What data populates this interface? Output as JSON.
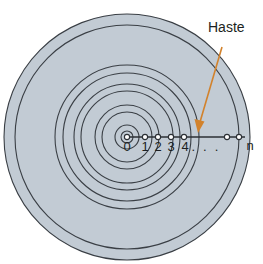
{
  "figure": {
    "title": "Haste",
    "background_color": "#ffffff"
  },
  "colors": {
    "band_fill": "#c2cbd4",
    "band_stroke": "#3a3f45",
    "axis_stroke": "#2b2f34",
    "pointer": "#d2822c",
    "text": "#1c1f22",
    "tick_fill": "#ffffff"
  },
  "callout": {
    "label": "Haste",
    "label_x": 196,
    "label_y": 22,
    "arrow_start_x": 222,
    "arrow_start_y": 47,
    "arrow_end_x": 198,
    "arrow_end_y": 130
  },
  "center": {
    "x": 127,
    "y": 137
  },
  "rings": [
    {
      "name": "ring-1",
      "outer_radius": 12,
      "inner_radius": 6
    },
    {
      "name": "ring-2",
      "outer_radius": 32,
      "inner_radius": 25
    },
    {
      "name": "ring-3",
      "outer_radius": 53,
      "inner_radius": 46
    },
    {
      "name": "ring-4",
      "outer_radius": 72,
      "inner_radius": 64
    },
    {
      "name": "ring-n",
      "outer_radius": 123,
      "inner_radius": 112
    }
  ],
  "axis": {
    "start_x": 127,
    "end_x": 245,
    "y": 137,
    "ticks": [
      {
        "label": "0",
        "x": 127
      },
      {
        "label": "1",
        "x": 145
      },
      {
        "label": "2",
        "x": 158
      },
      {
        "label": "3",
        "x": 171
      },
      {
        "label": "4",
        "x": 184
      },
      {
        "label": "n",
        "x": 239
      }
    ],
    "ellipsis": {
      "label": ". . .",
      "x": 206,
      "y": 140
    },
    "dot_positions": [
      127,
      145,
      158,
      171,
      184,
      227,
      239
    ],
    "label_y": 141
  }
}
